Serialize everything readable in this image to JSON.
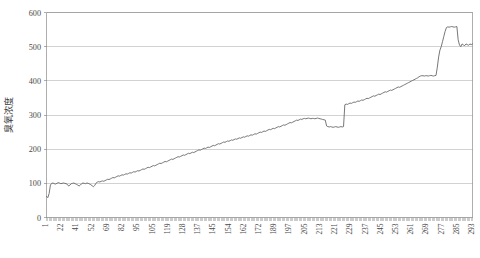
{
  "chart_data": {
    "type": "line",
    "title": "",
    "xlabel": "",
    "ylabel": "臭氧浓度",
    "ylim": [
      0,
      600
    ],
    "ytick_values": [
      0,
      100,
      200,
      300,
      400,
      500,
      600
    ],
    "grid": true,
    "legend": false,
    "legend_position": "none",
    "line_color": "#5f5f5f",
    "grid_color": "#bfbfbf",
    "frame_color": "#9a9a9a",
    "xtick_labels": [
      "1",
      "22",
      "41",
      "52",
      "69",
      "82",
      "95",
      "105",
      "119",
      "128",
      "137",
      "145",
      "154",
      "162",
      "172",
      "189",
      "197",
      "205",
      "213",
      "221",
      "229",
      "237",
      "245",
      "253",
      "261",
      "269",
      "277",
      "285",
      "293"
    ],
    "x_index_min": 1,
    "x_index_max": 298,
    "series": [
      {
        "name": "臭氧浓度",
        "values": [
          62,
          58,
          70,
          95,
          100,
          101,
          99,
          98,
          100,
          102,
          101,
          99,
          100,
          101,
          100,
          99,
          97,
          92,
          95,
          99,
          100,
          101,
          99,
          97,
          95,
          92,
          95,
          99,
          101,
          100,
          99,
          101,
          100,
          98,
          96,
          93,
          90,
          94,
          100,
          104,
          105,
          104,
          106,
          107,
          106,
          108,
          110,
          112,
          111,
          113,
          115,
          117,
          116,
          118,
          120,
          122,
          121,
          123,
          125,
          124,
          126,
          128,
          127,
          129,
          131,
          130,
          132,
          134,
          133,
          135,
          137,
          136,
          138,
          140,
          142,
          141,
          143,
          145,
          147,
          146,
          148,
          150,
          152,
          151,
          153,
          155,
          157,
          159,
          158,
          160,
          162,
          164,
          163,
          165,
          167,
          169,
          171,
          170,
          172,
          174,
          176,
          178,
          177,
          179,
          181,
          183,
          182,
          184,
          186,
          188,
          187,
          189,
          191,
          190,
          192,
          194,
          196,
          198,
          197,
          199,
          201,
          203,
          202,
          204,
          206,
          205,
          207,
          209,
          211,
          210,
          212,
          214,
          216,
          215,
          217,
          219,
          221,
          220,
          222,
          224,
          223,
          225,
          227,
          226,
          228,
          230,
          229,
          231,
          233,
          232,
          234,
          236,
          235,
          237,
          239,
          238,
          240,
          242,
          241,
          243,
          245,
          244,
          246,
          248,
          250,
          249,
          251,
          253,
          252,
          254,
          256,
          258,
          257,
          259,
          261,
          260,
          262,
          264,
          266,
          265,
          267,
          269,
          271,
          270,
          272,
          274,
          276,
          278,
          277,
          279,
          281,
          283,
          285,
          284,
          286,
          288,
          287,
          289,
          290,
          289,
          290,
          291,
          290,
          289,
          290,
          290,
          289,
          290,
          291,
          290,
          289,
          288,
          287,
          286,
          285,
          268,
          266,
          265,
          266,
          265,
          264,
          265,
          266,
          265,
          264,
          265,
          266,
          265,
          266,
          330,
          332,
          331,
          333,
          335,
          334,
          336,
          338,
          337,
          339,
          341,
          340,
          342,
          344,
          343,
          345,
          347,
          349,
          348,
          350,
          352,
          354,
          356,
          355,
          357,
          359,
          361,
          360,
          362,
          364,
          366,
          368,
          367,
          369,
          371,
          373,
          372,
          374,
          376,
          378,
          380,
          382,
          381,
          383,
          385,
          387,
          389,
          391,
          393,
          395,
          397,
          399,
          401,
          403,
          405,
          407,
          409,
          412,
          414,
          415,
          415,
          414,
          415,
          415,
          414,
          415,
          416,
          415,
          414,
          415,
          416,
          440,
          470,
          490,
          500,
          515,
          530,
          545,
          556,
          558,
          557,
          558,
          559,
          558,
          557,
          558,
          559,
          520,
          505,
          500,
          508,
          505,
          503,
          508,
          506,
          504,
          508,
          506,
          508
        ]
      }
    ]
  }
}
